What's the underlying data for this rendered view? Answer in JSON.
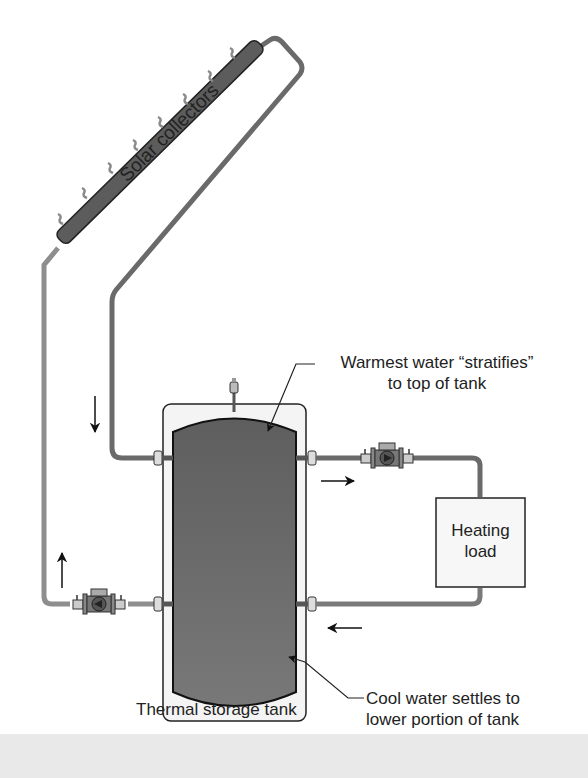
{
  "diagram": {
    "labels": {
      "solar_collectors": "Solar collectors",
      "warmest_line1": "Warmest water “stratifies”",
      "warmest_line2": "to top of tank",
      "heating_line1": "Heating",
      "heating_line2": "load",
      "tank": "Thermal storage tank",
      "cool_line1": "Cool water settles to",
      "cool_line2": "lower portion of tank"
    },
    "components": [
      "solar-collector-panel",
      "thermal-storage-tank",
      "collector-circulator-pump",
      "load-circulator-pump",
      "heating-load",
      "air-vent"
    ],
    "flow_arrows": [
      "down (collector return to tank top)",
      "up (supply to collector)",
      "right (tank to load)",
      "left (load return to tank)"
    ],
    "colors": {
      "pipe": "#6e6e6e",
      "pipe_supply": "#8a8a8a",
      "tank_fill": "#6a6a6a",
      "tank_jacket": "#f2f2f2",
      "collector": "#5c5c5c",
      "outline": "#222222",
      "band": "#e9e9e9"
    }
  }
}
